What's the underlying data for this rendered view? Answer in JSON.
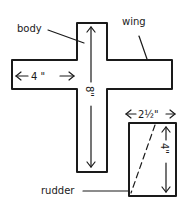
{
  "diagram": {
    "labels": {
      "body": "body",
      "wing": "wing",
      "rudder": "rudder"
    },
    "dimensions": {
      "wing_half": "4 \"",
      "body_length": "8\"",
      "rudder_width": "2½\"",
      "rudder_height": "4\""
    },
    "colors": {
      "ink": "#1a1a1a",
      "background": "#ffffff"
    }
  }
}
